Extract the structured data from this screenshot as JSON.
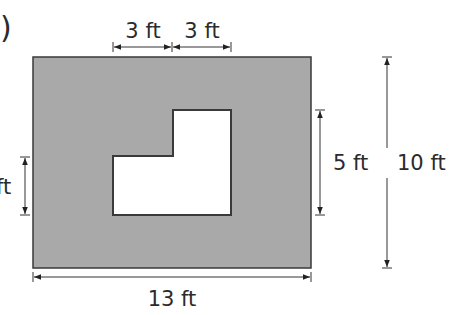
{
  "figure": {
    "label_fragment": ")",
    "colors": {
      "shaded": "#a9a9a9",
      "outline": "#3a3a3a",
      "cutout": "#ffffff",
      "dimension": "#333333",
      "text": "#2b2b2b"
    },
    "outer_rectangle": {
      "width_label": "13 ft",
      "height_label": "10 ft"
    },
    "cutout": {
      "top_left_width_label": "3 ft",
      "top_right_width_label": "3 ft",
      "right_height_label": "5 ft",
      "left_height_label": "ft"
    }
  }
}
